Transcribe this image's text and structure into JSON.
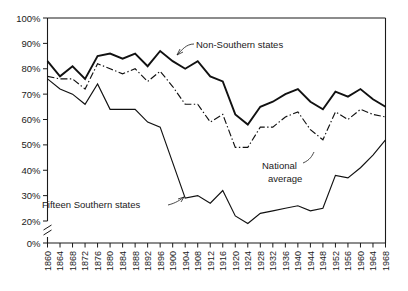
{
  "chart_data": {
    "type": "line",
    "title": "",
    "subtitle": "",
    "xlabel": "",
    "ylabel": "",
    "xlim": [
      1860,
      1968
    ],
    "ylim": [
      20,
      100
    ],
    "y_axis_break": "0%",
    "grid": false,
    "legend": "inline-annotations",
    "y_tick_labels": [
      "100%",
      "90%",
      "80%",
      "70%",
      "60%",
      "50%",
      "40%",
      "30%",
      "20%",
      "0%"
    ],
    "y_tick_values": [
      100,
      90,
      80,
      70,
      60,
      50,
      40,
      30,
      20,
      0
    ],
    "x": [
      1860,
      1864,
      1868,
      1872,
      1876,
      1880,
      1884,
      1888,
      1892,
      1896,
      1900,
      1904,
      1908,
      1912,
      1916,
      1920,
      1924,
      1928,
      1932,
      1936,
      1940,
      1944,
      1948,
      1952,
      1956,
      1960,
      1964,
      1968
    ],
    "x_tick_labels": [
      "1860",
      "1864",
      "1868",
      "1872",
      "1876",
      "1880",
      "1884",
      "1888",
      "1892",
      "1896",
      "1900",
      "1904",
      "1908",
      "1912",
      "1916",
      "1920",
      "1924",
      "1928",
      "1932",
      "1936",
      "1940",
      "1944",
      "1948",
      "1952",
      "1956",
      "1960",
      "1964",
      "1968"
    ],
    "series": [
      {
        "name": "Non-Southern states",
        "style": "solid-thick",
        "annotation": "Non-Southern states",
        "values": [
          83,
          77,
          81,
          76,
          85,
          86,
          84,
          86,
          81,
          87,
          83,
          80,
          83,
          77,
          75,
          62,
          58,
          65,
          67,
          70,
          72,
          67,
          64,
          71,
          69,
          72,
          68,
          65
        ]
      },
      {
        "name": "National average",
        "style": "dash-dot",
        "annotation": "National average",
        "values": [
          77,
          76,
          76,
          72,
          82,
          80,
          78,
          80,
          75,
          79,
          73,
          66,
          66,
          59,
          62,
          49,
          49,
          57,
          57,
          61,
          63,
          56,
          52,
          63,
          60,
          64,
          62,
          61
        ]
      },
      {
        "name": "Fifteen Southern states",
        "style": "solid-thin",
        "annotation": "Fifteen Southern states",
        "values": [
          76,
          72,
          70,
          66,
          74,
          64,
          64,
          64,
          59,
          57,
          43,
          29,
          30,
          27,
          32,
          22,
          19,
          23,
          24,
          25,
          26,
          24,
          25,
          38,
          37,
          41,
          46,
          52
        ]
      }
    ],
    "annotations": [
      {
        "label": "Non-Southern states",
        "for": "Non-Southern states"
      },
      {
        "label": "National average",
        "for": "National average"
      },
      {
        "label": "Fifteen Southern states",
        "for": "Fifteen Southern states"
      }
    ]
  }
}
